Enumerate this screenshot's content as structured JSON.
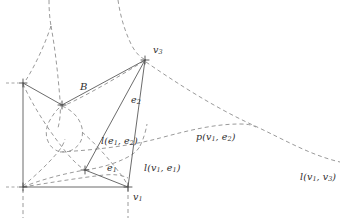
{
  "figure": {
    "kind": "geometric-diagram",
    "background_color": "#ffffff",
    "solid_stroke_color": "#5a5a5a",
    "dashed_stroke_color": "#8f8f8f",
    "labels": {
      "v3": "v",
      "v3_sub": "3",
      "B": "B",
      "e2": "e",
      "e2_sub": "2",
      "l_e1_e2_head": "l(",
      "l_e1_e2_a": "e",
      "l_e1_e2_a_sub": "1",
      "l_e1_e2_comma": ", ",
      "l_e1_e2_b": "e",
      "l_e1_e2_b_sub": "2",
      "l_e1_e2_tail": ")",
      "e1": "e",
      "e1_sub": "1",
      "l_v1_e1_head": "l(",
      "l_v1_e1_a": "v",
      "l_v1_e1_a_sub": "1",
      "l_v1_e1_comma": ", ",
      "l_v1_e1_b": "e",
      "l_v1_e1_b_sub": "1",
      "l_v1_e1_tail": ")",
      "p_v1_e2_head": "p(",
      "p_v1_e2_a": "v",
      "p_v1_e2_a_sub": "1",
      "p_v1_e2_comma": ", ",
      "p_v1_e2_b": "e",
      "p_v1_e2_b_sub": "2",
      "p_v1_e2_tail": ")",
      "l_v1_v3_head": "l(",
      "l_v1_v3_a": "v",
      "l_v1_v3_a_sub": "1",
      "l_v1_v3_comma": ", ",
      "l_v1_v3_b": "v",
      "l_v1_v3_b_sub": "3",
      "l_v1_v3_tail": ")",
      "v1": "v",
      "v1_sub": "1"
    },
    "vertices": {
      "v3": [
        145,
        60
      ],
      "v1": [
        128,
        187
      ],
      "corner_top_left": [
        22,
        83
      ],
      "corner_bottom_left": [
        22,
        187
      ],
      "junction_mid": [
        62,
        105
      ],
      "e1_point": [
        85,
        170
      ]
    }
  }
}
